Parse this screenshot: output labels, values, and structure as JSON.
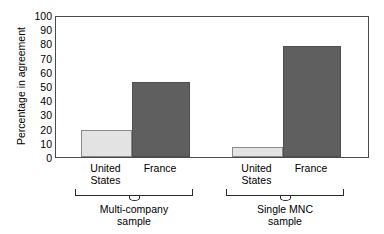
{
  "chart_data": {
    "type": "bar",
    "title": "",
    "xlabel": "",
    "ylabel": "Percentage in agreement",
    "ylim": [
      0,
      100
    ],
    "ytick_labels": [
      "100",
      "90",
      "80",
      "70",
      "60",
      "50",
      "40",
      "30",
      "20",
      "10",
      "0"
    ],
    "ytick_values": [
      100,
      90,
      80,
      70,
      60,
      50,
      40,
      30,
      20,
      10,
      0
    ],
    "grid": false,
    "legend": "none",
    "categories": [
      "United States",
      "France"
    ],
    "groups": [
      {
        "label_line1": "Multi-company",
        "label_line2": "sample",
        "bars": [
          {
            "category_line1": "United",
            "category_line2": "States",
            "value": 19,
            "color": "#e3e3e3"
          },
          {
            "category_line1": "France",
            "category_line2": "",
            "value": 53,
            "color": "#5f5f5f"
          }
        ]
      },
      {
        "label_line1": "Single MNC",
        "label_line2": "sample",
        "bars": [
          {
            "category_line1": "United",
            "category_line2": "States",
            "value": 7,
            "color": "#e3e3e3"
          },
          {
            "category_line1": "France",
            "category_line2": "",
            "value": 78,
            "color": "#5f5f5f"
          }
        ]
      }
    ],
    "series": [
      {
        "name": "United States",
        "values": [
          19,
          7
        ],
        "color": "#e3e3e3"
      },
      {
        "name": "France",
        "values": [
          53,
          78
        ],
        "color": "#5f5f5f"
      }
    ],
    "colors": {
      "light_bar": "#e3e3e3",
      "dark_bar": "#5f5f5f",
      "axis": "#4a4a4a",
      "text": "#000000"
    }
  }
}
